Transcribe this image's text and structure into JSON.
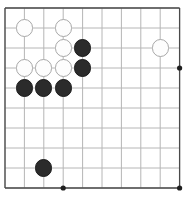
{
  "figure": {
    "kind": "go-board-diagram",
    "width_px": 194,
    "height_px": 208
  },
  "board": {
    "grid": {
      "columns": 10,
      "rows": 10,
      "origin_x": 5,
      "origin_y": 8,
      "spacing_x": 19.4,
      "spacing_y": 20.0,
      "line_color": "#b6b6b6",
      "edge_color": "#4a4a4a",
      "background_color": "#ffffff"
    },
    "star_points": {
      "color": "#1f1f1f",
      "radius_px": 2.6,
      "points": [
        {
          "col": 9,
          "row": 3
        },
        {
          "col": 3,
          "row": 9
        },
        {
          "col": 9,
          "row": 9
        }
      ]
    },
    "stones": {
      "black_color": "#2b2b2b",
      "white_color": "#fdfdfd",
      "white_outline_color": "#a8a8a8",
      "radius_px": 8.6,
      "list": [
        {
          "color": "white",
          "col": 1,
          "row": 1,
          "label": "white-stone-c1r1"
        },
        {
          "color": "white",
          "col": 3,
          "row": 1,
          "label": "white-stone-c3r1"
        },
        {
          "color": "white",
          "col": 3,
          "row": 2,
          "label": "white-stone-c3r2"
        },
        {
          "color": "black",
          "col": 4,
          "row": 2,
          "label": "black-stone-c4r2"
        },
        {
          "color": "white",
          "col": 8,
          "row": 2,
          "label": "white-stone-c8r2"
        },
        {
          "color": "white",
          "col": 1,
          "row": 3,
          "label": "white-stone-c1r3"
        },
        {
          "color": "white",
          "col": 2,
          "row": 3,
          "label": "white-stone-c2r3"
        },
        {
          "color": "white",
          "col": 3,
          "row": 3,
          "label": "white-stone-c3r3"
        },
        {
          "color": "black",
          "col": 4,
          "row": 3,
          "label": "black-stone-c4r3"
        },
        {
          "color": "black",
          "col": 1,
          "row": 4,
          "label": "black-stone-c1r4"
        },
        {
          "color": "black",
          "col": 2,
          "row": 4,
          "label": "black-stone-c2r4"
        },
        {
          "color": "black",
          "col": 3,
          "row": 4,
          "label": "black-stone-c3r4"
        },
        {
          "color": "black",
          "col": 2,
          "row": 8,
          "label": "black-stone-c2r8"
        }
      ]
    },
    "counts": {
      "black_stones": 6,
      "white_stones": 7,
      "total_stones": 13
    }
  }
}
